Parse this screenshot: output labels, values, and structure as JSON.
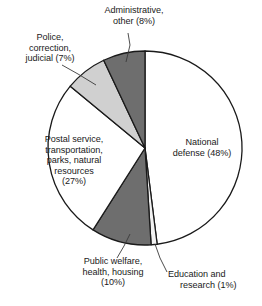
{
  "chart_data": {
    "type": "pie",
    "title": "",
    "subtitle": "",
    "xlabel": "",
    "ylabel": "",
    "legend_position": "none",
    "grid": false,
    "units": "percent",
    "categories": [
      "National defense",
      "Education and research",
      "Public welfare, health, housing",
      "Postal service, transportation, parks, natural resources",
      "Police, correction, judicial",
      "Administrative, other"
    ],
    "values": [
      48,
      1,
      10,
      27,
      7,
      8
    ],
    "slices": [
      {
        "name": "national-defense",
        "value": 48,
        "value_label": "48%",
        "fill": "#ffffff",
        "start_angle": 0,
        "end_angle": 172.8,
        "label_lines": [
          "National",
          "defense (48%)"
        ],
        "label_placement": "inside-right"
      },
      {
        "name": "education-and-research",
        "value": 1,
        "value_label": "1%",
        "fill": "#f2f2f2",
        "start_angle": 172.8,
        "end_angle": 176.4,
        "label_lines": [
          "Education and",
          "research (1%)"
        ],
        "label_placement": "outside-bottom-right"
      },
      {
        "name": "public-welfare-health-housing",
        "value": 10,
        "value_label": "10%",
        "fill": "#6e6e6e",
        "start_angle": 176.4,
        "end_angle": 212.4,
        "label_lines": [
          "Public welfare,",
          "health, housing",
          "(10%)"
        ],
        "label_placement": "outside-bottom"
      },
      {
        "name": "postal-transportation-parks-natural-resources",
        "value": 27,
        "value_label": "27%",
        "fill": "#ffffff",
        "start_angle": 212.4,
        "end_angle": 309.6,
        "label_lines": [
          "Postal service,",
          "transportation,",
          "parks, natural",
          "resources",
          "(27%)"
        ],
        "label_placement": "inside-left"
      },
      {
        "name": "police-correction-judicial",
        "value": 7,
        "value_label": "7%",
        "fill": "#d0d0d0",
        "start_angle": 309.6,
        "end_angle": 334.8,
        "label_lines": [
          "Police,",
          "correction,",
          "judicial (7%)"
        ],
        "label_placement": "outside-top-left"
      },
      {
        "name": "administrative-other",
        "value": 8,
        "value_label": "8%",
        "fill": "#6e6e6e",
        "start_angle": 334.8,
        "end_angle": 360,
        "label_lines": [
          "Administrative,",
          "other (8%)"
        ],
        "label_placement": "outside-top"
      }
    ],
    "colors": {
      "dark_gray": "#6e6e6e",
      "light_gray": "#d0d0d0",
      "white": "#ffffff",
      "outline": "#1a1a1a",
      "text": "#1a1a1a"
    },
    "geometry": {
      "center_x": 145,
      "center_y": 148,
      "radius": 97
    }
  },
  "labels": {
    "administrative": {
      "line1": "Administrative,",
      "line2": "other (8%)"
    },
    "police": {
      "line1": "Police,",
      "line2": "correction,",
      "line3": "judicial (7%)"
    },
    "postal": {
      "line1": "Postal service,",
      "line2": "transportation,",
      "line3": "parks, natural",
      "line4": "resources",
      "line5": "(27%)"
    },
    "defense": {
      "line1": "National",
      "line2": "defense (48%)"
    },
    "welfare": {
      "line1": "Public welfare,",
      "line2": "health, housing",
      "line3": "(10%)"
    },
    "education": {
      "line1": "Education and",
      "line2": "research (1%)"
    }
  }
}
